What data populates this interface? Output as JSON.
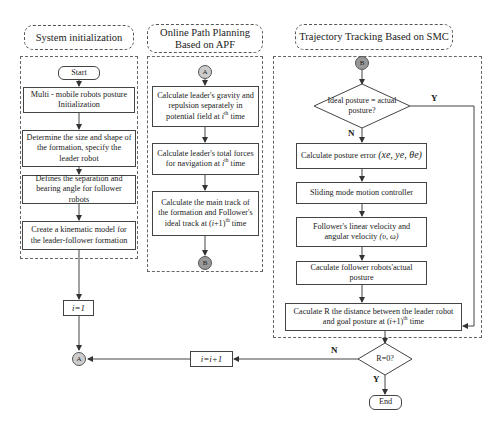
{
  "sections": {
    "init": {
      "title": "System initialization"
    },
    "apf": {
      "title": "Online Path Planning Based on APF"
    },
    "smc": {
      "title": "Trajectory Tracking Based on SMC"
    }
  },
  "init_steps": {
    "start": "Start",
    "s1": "Multi - mobile robots posture Initialization",
    "s2": "Determine the size and shape of the formation, specify the leader robot",
    "s3": "Defines the separation and bearing angle for follower robots",
    "s4": "Create a kinematic model for the leader-follower formation"
  },
  "apf_steps": {
    "s1_a": "Calculate leader's gravity and repulsion separately in potential field at ",
    "s1_i": "i",
    "s1_sup": "th",
    "s1_b": " time",
    "s2_a": "Calculate leader's total forces for navigation at ",
    "s2_i": "i",
    "s2_sup": "th",
    "s2_b": " time",
    "s3_a": "Calculate the main track of the formation and Follower's ideal track at (",
    "s3_i": "i",
    "s3_c": "+1)",
    "s3_sup": "th",
    "s3_b": "  time"
  },
  "smc_steps": {
    "decision1": "Ideal posture = actual posture?",
    "d1_yes": "Y",
    "d1_no": "N",
    "s1_a": "Calculate posture error ",
    "s1_math": "(xe, ye, θe)",
    "s2": "Sliding mode motion controller",
    "s3_a": "Follower's linear velocity and angular velocity ",
    "s3_math": "(υ, ω)",
    "s4": "Caculate follower robots'actual posture",
    "s5_a": "Caculate R the distance between the leader robot and goal posture at (",
    "s5_i": "i",
    "s5_c": "+1)",
    "s5_sup": "th",
    "s5_b": "  time"
  },
  "loop": {
    "init_counter": "i=1",
    "increment": "i=i+1",
    "decision2": "R=0?",
    "d2_yes": "Y",
    "d2_no": "N",
    "end": "End"
  },
  "connectors": {
    "a": "A",
    "b": "B"
  }
}
